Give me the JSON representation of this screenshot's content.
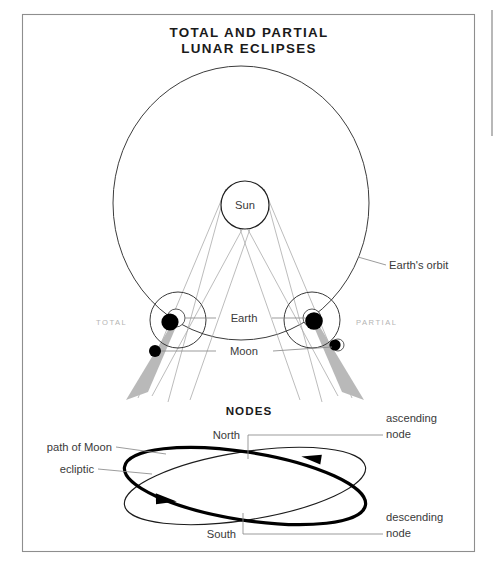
{
  "figure": {
    "title_line1": "TOTAL AND PARTIAL",
    "title_line2": "LUNAR ECLIPSES",
    "section_heading": "NODES"
  },
  "eclipse_diagram": {
    "sun_label": "Sun",
    "earth_label": "Earth",
    "moon_label": "Moon",
    "orbit_label": "Earth's orbit",
    "total_label": "TOTAL",
    "partial_label": "PARTIAL"
  },
  "nodes_diagram": {
    "north_label": "North",
    "south_label": "South",
    "moon_path_label": "path of Moon",
    "ecliptic_label": "ecliptic",
    "ascending_line1": "ascending",
    "ascending_line2": "node",
    "descending_line1": "descending",
    "descending_line2": "node"
  },
  "colors": {
    "frame": "#8e8e8e",
    "ink": "#231f20",
    "ray": "#a6a6a6",
    "umbra": "#b9b9b9",
    "faint_caps": "#b4b4b4",
    "leader": "#8a8a8a"
  }
}
